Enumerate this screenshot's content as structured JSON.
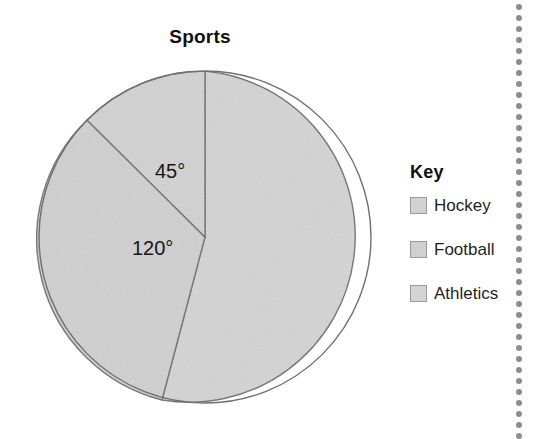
{
  "chart": {
    "title": "Sports"
  },
  "legend": {
    "title": "Key",
    "items": [
      {
        "label": "Hockey",
        "color": "#d2d2d2"
      },
      {
        "label": "Football",
        "color": "#d0d0d0"
      },
      {
        "label": "Athletics",
        "color": "#d4d4d4"
      }
    ]
  },
  "annotations": {
    "angle_hockey": "45°",
    "angle_football": "120°"
  },
  "decoration": {
    "dot_color": "#8d8d8d",
    "dot_count": 40,
    "dot_spacing": 11
  },
  "chart_data": {
    "type": "pie",
    "title": "Sports",
    "categories": [
      "Hockey",
      "Football",
      "Athletics"
    ],
    "values": [
      45,
      120,
      195
    ],
    "value_unit": "degrees",
    "labels_shown": [
      "45°",
      "120°",
      ""
    ],
    "start_angle_deg": 0,
    "direction": "counterclockwise",
    "legend": "right",
    "grid": false,
    "slice_colors": [
      "#d2d2d2",
      "#d0d0d0",
      "#d4d4d4"
    ],
    "slice_border_color": "#6f6f6f",
    "center_px": [
      205,
      237
    ],
    "radius_px": 166
  }
}
